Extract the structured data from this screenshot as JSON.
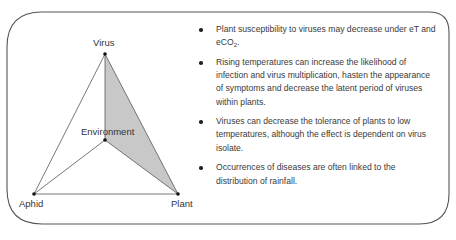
{
  "diagram": {
    "type": "disease-tetrahedron",
    "nodes": {
      "virus": "Virus",
      "environment": "Environment",
      "aphid": "Aphid",
      "plant": "Plant"
    },
    "shaded_face": [
      "Virus",
      "Plant",
      "Environment"
    ],
    "colors": {
      "border": "#555555",
      "edges": "#555555",
      "shade": "#c8c8c8",
      "points": "#111111"
    }
  },
  "bullets": [
    {
      "text": "Plant susceptibility to viruses may decrease under eT and eCO",
      "sub": "2",
      "tail": "."
    },
    {
      "text": "Rising temperatures can increase the likelihood of infection and virus multiplication, hasten the appearance of symptoms and decrease the latent period of viruses within plants."
    },
    {
      "text": "Viruses can decrease the tolerance of plants to low temperatures, although the effect is dependent on virus isolate."
    },
    {
      "text": "Occurrences of diseases are often linked to the distribution of rainfall."
    }
  ]
}
